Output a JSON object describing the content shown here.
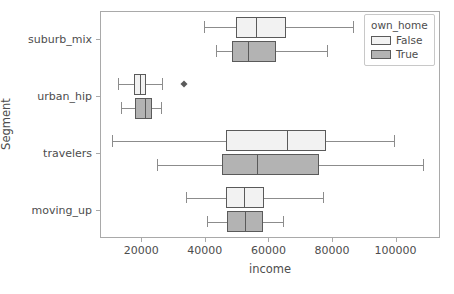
{
  "chart_data": {
    "type": "box",
    "orientation": "horizontal",
    "title": "",
    "xlabel": "income",
    "ylabel": "Segment",
    "xlim": [
      7000,
      114000
    ],
    "xticks": [
      20000,
      40000,
      60000,
      80000,
      100000
    ],
    "xticklabels": [
      "20000",
      "40000",
      "60000",
      "80000",
      "100000"
    ],
    "categories": [
      "suburb_mix",
      "urban_hip",
      "travelers",
      "moving_up"
    ],
    "grid": false,
    "legend": {
      "title": "own_home",
      "position": "upper right",
      "entries": [
        {
          "label": "False",
          "color": "#f2f2f2"
        },
        {
          "label": "True",
          "color": "#b3b3b3"
        }
      ]
    },
    "series": [
      {
        "name": "False",
        "color": "#f2f2f2",
        "boxes": [
          {
            "category": "suburb_mix",
            "whisker_low": 39700,
            "q1": 49700,
            "median": 56000,
            "q3": 65500,
            "whisker_high": 86500,
            "fliers": []
          },
          {
            "category": "urban_hip",
            "whisker_low": 12800,
            "q1": 17800,
            "median": 19700,
            "q3": 21600,
            "whisker_high": 26600,
            "fliers": [
              33300
            ]
          },
          {
            "category": "travelers",
            "whisker_low": 10800,
            "q1": 46500,
            "median": 66000,
            "q3": 78100,
            "whisker_high": 99500,
            "fliers": []
          },
          {
            "category": "moving_up",
            "whisker_low": 34000,
            "q1": 46600,
            "median": 52300,
            "q3": 58500,
            "whisker_high": 77300,
            "fliers": []
          }
        ]
      },
      {
        "name": "True",
        "color": "#b3b3b3",
        "boxes": [
          {
            "category": "suburb_mix",
            "whisker_low": 43500,
            "q1": 48600,
            "median": 53700,
            "q3": 62400,
            "whisker_high": 78400,
            "fliers": []
          },
          {
            "category": "urban_hip",
            "whisker_low": 13700,
            "q1": 17900,
            "median": 21300,
            "q3": 23300,
            "whisker_high": 26200,
            "fliers": []
          },
          {
            "category": "travelers",
            "whisker_low": 24900,
            "q1": 45500,
            "median": 56300,
            "q3": 76000,
            "whisker_high": 108500,
            "fliers": []
          },
          {
            "category": "moving_up",
            "whisker_low": 40800,
            "q1": 46900,
            "median": 52600,
            "q3": 58300,
            "whisker_high": 64600,
            "fliers": []
          }
        ]
      }
    ]
  }
}
